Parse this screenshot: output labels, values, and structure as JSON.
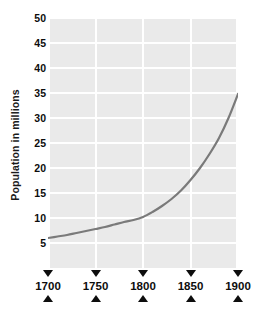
{
  "chart_data": {
    "type": "line",
    "title": "",
    "xlabel": "",
    "ylabel": "Population in millions",
    "xlim": [
      1700,
      1900
    ],
    "ylim": [
      0,
      50
    ],
    "grid": true,
    "legend": false,
    "line_color": "#7a7a7a",
    "plot_background": "#eaeaea",
    "gridline_color": "#ffffff",
    "x_tick_labels": [
      "1700",
      "1750",
      "1800",
      "1850",
      "1900"
    ],
    "x_ticks": [
      1700,
      1750,
      1800,
      1850,
      1900
    ],
    "y_tick_labels": [
      "5",
      "10",
      "15",
      "20",
      "25",
      "30",
      "35",
      "40",
      "45",
      "50"
    ],
    "y_ticks": [
      5,
      10,
      15,
      20,
      25,
      30,
      35,
      40,
      45,
      50
    ],
    "series": [
      {
        "name": "Population",
        "x": [
          1700,
          1710,
          1720,
          1730,
          1740,
          1750,
          1760,
          1770,
          1780,
          1790,
          1800,
          1810,
          1820,
          1830,
          1840,
          1850,
          1860,
          1870,
          1880,
          1890,
          1900
        ],
        "values": [
          6.0,
          6.3,
          6.6,
          7.0,
          7.4,
          7.8,
          8.2,
          8.7,
          9.2,
          9.6,
          10.2,
          11.2,
          12.4,
          13.8,
          15.5,
          17.6,
          20.0,
          22.8,
          26.0,
          30.0,
          34.8
        ]
      }
    ]
  }
}
